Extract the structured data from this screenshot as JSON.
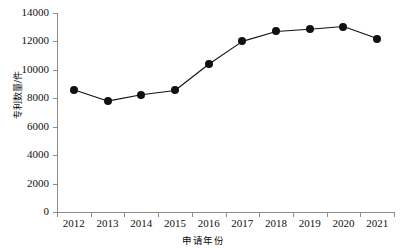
{
  "chart_data": {
    "type": "line",
    "title": "",
    "subtitle": "",
    "xlabel": "申请年份",
    "ylabel": "专利数量/件",
    "categories": [
      "2012",
      "2013",
      "2014",
      "2015",
      "2016",
      "2017",
      "2018",
      "2019",
      "2020",
      "2021"
    ],
    "values": [
      8600,
      7800,
      8250,
      8550,
      10400,
      12000,
      12700,
      12850,
      13050,
      12200
    ],
    "series": [
      {
        "name": "专利数量",
        "values": [
          8600,
          7800,
          8250,
          8550,
          10400,
          12000,
          12700,
          12850,
          13050,
          12200
        ]
      }
    ],
    "ylim": [
      0,
      14000
    ],
    "yticks": [
      0,
      2000,
      4000,
      6000,
      8000,
      10000,
      12000,
      14000
    ],
    "ytick_labels": [
      "0",
      "2000",
      "4000",
      "6000",
      "8000",
      "10000",
      "12000",
      "14000"
    ],
    "xticks": [
      "2012",
      "2013",
      "2014",
      "2015",
      "2016",
      "2017",
      "2018",
      "2019",
      "2020",
      "2021"
    ],
    "grid": false,
    "legend": false,
    "legend_position": "none",
    "marker": "filled-circle",
    "colors": {
      "line": "#111111",
      "marker": "#111111",
      "axis": "#8d8d8d",
      "text": "#111111",
      "background": "#ffffff"
    }
  }
}
